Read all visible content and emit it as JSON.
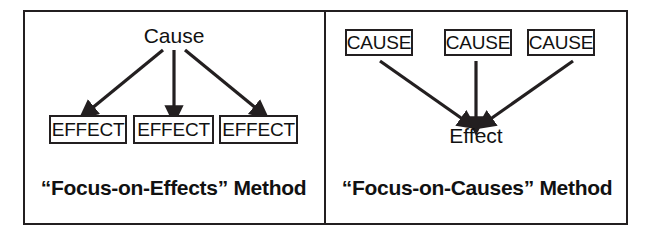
{
  "figure": {
    "background_color": "#ffffff",
    "line_color": "#231f20",
    "text_color": "#111111",
    "panel_count": 2
  },
  "panels": [
    {
      "id": "focus-on-effects",
      "caption": "“Focus-on-Effects” Method",
      "source_nodes": [
        {
          "label": "Cause",
          "boxed": false
        }
      ],
      "target_nodes": [
        {
          "label": "EFFECT",
          "boxed": true
        },
        {
          "label": "EFFECT",
          "boxed": true
        },
        {
          "label": "EFFECT",
          "boxed": true
        }
      ],
      "arrow_direction": "one-to-many",
      "arrow_count": 3
    },
    {
      "id": "focus-on-causes",
      "caption": "“Focus-on-Causes” Method",
      "source_nodes": [
        {
          "label": "CAUSE",
          "boxed": true
        },
        {
          "label": "CAUSE",
          "boxed": true
        },
        {
          "label": "CAUSE",
          "boxed": true
        }
      ],
      "target_nodes": [
        {
          "label": "Effect",
          "boxed": false
        }
      ],
      "arrow_direction": "many-to-one",
      "arrow_count": 3
    }
  ]
}
